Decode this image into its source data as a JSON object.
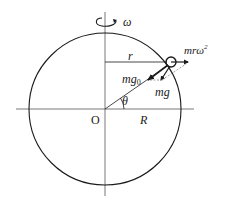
{
  "diagram": {
    "type": "physics-free-body",
    "colors": {
      "stroke": "#1a1a1a",
      "axis": "#555555",
      "background": "#ffffff"
    },
    "labels": {
      "omega": "ω",
      "r": "r",
      "centripetal": "mrω",
      "centripetal_sup": "2",
      "mg0": "mg",
      "mg0_sub": "0",
      "mg": "mg",
      "theta": "θ",
      "origin": "O",
      "R": "R"
    },
    "geometry": {
      "center": [
        105,
        109
      ],
      "radius": 76,
      "mass_position": [
        171,
        62
      ],
      "angle_theta_deg": 36
    }
  }
}
